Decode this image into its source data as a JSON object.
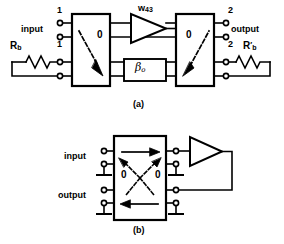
{
  "figure": {
    "panels": [
      {
        "caption": "(a)",
        "terminal_labels": {
          "in_top": "1",
          "in_bottom": "1",
          "out_top": "2",
          "out_bottom": "2"
        },
        "port_labels": {
          "input": "input",
          "output": "output"
        },
        "resistors": {
          "left": "R",
          "left_sub": "b",
          "right": "R",
          "right_sub": "b",
          "right_prime": "′"
        },
        "blocks": {
          "left_nullor": "0",
          "right_nullor": "0",
          "feedback_box": "β",
          "feedback_box_sub": "o"
        },
        "amplifier": {
          "gain": "w",
          "gain_sub": "43"
        }
      },
      {
        "caption": "(b)",
        "port_labels": {
          "input": "input",
          "output": "output"
        },
        "blocks": {
          "zero_left": "0",
          "zero_right": "0"
        }
      }
    ]
  }
}
